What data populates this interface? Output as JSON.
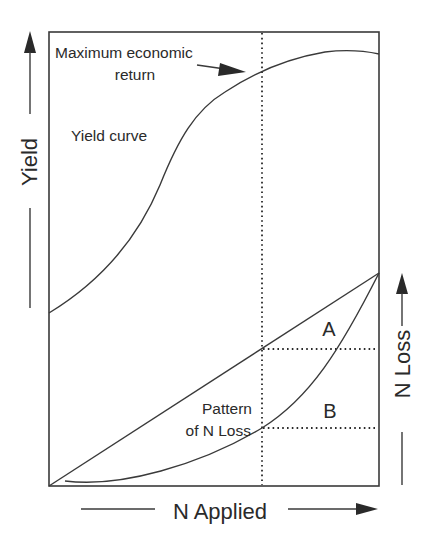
{
  "diagram": {
    "labels": {
      "max_return_line1": "Maximum economic",
      "max_return_line2": "return",
      "yield_curve": "Yield curve",
      "pattern_line1": "Pattern",
      "pattern_line2": "of N Loss",
      "region_a": "A",
      "region_b": "B"
    },
    "axes": {
      "y_left": "Yield",
      "y_right": "N Loss",
      "x": "N Applied"
    },
    "icons": {
      "yield_arrow": "arrow-up-icon",
      "n_loss_arrow": "arrow-up-icon",
      "n_applied_arrow": "arrow-right-icon",
      "max_return_pointer": "arrow-right-icon"
    },
    "colors": {
      "ink": "#2a2a2a",
      "background": "#ffffff"
    }
  }
}
